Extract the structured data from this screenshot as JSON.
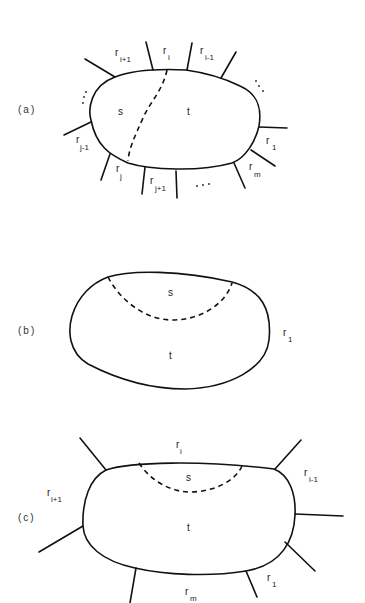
{
  "figure": {
    "panels": [
      {
        "id": "a",
        "label": "(a)",
        "regions": {
          "s": "s",
          "t": "t"
        },
        "edge_labels": [
          {
            "base": "r",
            "sub": "i+1"
          },
          {
            "base": "r",
            "sub": "i"
          },
          {
            "base": "r",
            "sub": "i-1"
          },
          {
            "base": "r",
            "sub": "1"
          },
          {
            "base": "r",
            "sub": "m"
          },
          {
            "base": "r",
            "sub": "j+1"
          },
          {
            "base": "r",
            "sub": "j"
          },
          {
            "base": "r",
            "sub": "j-1"
          }
        ],
        "ellipses": [
          "...",
          "...",
          "..."
        ]
      },
      {
        "id": "b",
        "label": "(b)",
        "regions": {
          "s": "s",
          "t": "t"
        },
        "edge_labels": [
          {
            "base": "r",
            "sub": "1"
          }
        ]
      },
      {
        "id": "c",
        "label": "(c)",
        "regions": {
          "s": "s",
          "t": "t"
        },
        "edge_labels": [
          {
            "base": "r",
            "sub": "i"
          },
          {
            "base": "r",
            "sub": "i-1"
          },
          {
            "base": "r",
            "sub": "i+1"
          },
          {
            "base": "r",
            "sub": "1"
          },
          {
            "base": "r",
            "sub": "m"
          }
        ]
      }
    ]
  }
}
